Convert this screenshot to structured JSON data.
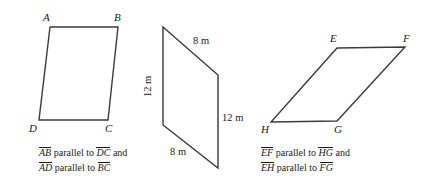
{
  "figure": {
    "background_color": "#ffffff",
    "stroke_color": "#333333",
    "shapes": [
      {
        "id": "parallelogram-abcd",
        "name": "left-parallelogram",
        "vertices": [
          {
            "label": "A",
            "x": 50,
            "y": 27
          },
          {
            "label": "B",
            "x": 118,
            "y": 27
          },
          {
            "label": "C",
            "x": 108,
            "y": 120
          },
          {
            "label": "D",
            "x": 39,
            "y": 120
          }
        ],
        "vertex_labels": [
          {
            "text": "A",
            "x": 43,
            "y": 12
          },
          {
            "text": "B",
            "x": 114,
            "y": 12
          },
          {
            "text": "C",
            "x": 105,
            "y": 123
          },
          {
            "text": "D",
            "x": 29,
            "y": 123
          }
        ],
        "caption": [
          {
            "seg1": "AB",
            "mid": " parallel to ",
            "seg2": "DC",
            "tail": " and"
          },
          {
            "seg1": "AD",
            "mid": " parallel to ",
            "seg2": "BC",
            "tail": ""
          }
        ]
      },
      {
        "id": "parallelogram-middle",
        "name": "middle-parallelogram",
        "vertices": [
          {
            "label": "",
            "x": 163,
            "y": 27
          },
          {
            "label": "",
            "x": 218,
            "y": 75
          },
          {
            "label": "",
            "x": 218,
            "y": 168
          },
          {
            "label": "",
            "x": 163,
            "y": 125
          }
        ],
        "dimensions": [
          {
            "text": "8 m",
            "x": 193,
            "y": 36,
            "orientation": "horizontal",
            "side": "top"
          },
          {
            "text": "12 m",
            "x": 147,
            "y": 92,
            "orientation": "vertical",
            "side": "left"
          },
          {
            "text": "12 m",
            "x": 222,
            "y": 113,
            "orientation": "horizontal",
            "side": "right"
          },
          {
            "text": "8 m",
            "x": 170,
            "y": 146,
            "orientation": "horizontal",
            "side": "bottom"
          }
        ]
      },
      {
        "id": "parallelogram-efgh",
        "name": "right-parallelogram",
        "vertices": [
          {
            "label": "E",
            "x": 337,
            "y": 48
          },
          {
            "label": "F",
            "x": 405,
            "y": 47
          },
          {
            "label": "G",
            "x": 337,
            "y": 121
          },
          {
            "label": "H",
            "x": 271,
            "y": 122
          }
        ],
        "vertex_labels": [
          {
            "text": "E",
            "x": 330,
            "y": 33
          },
          {
            "text": "F",
            "x": 403,
            "y": 33
          },
          {
            "text": "G",
            "x": 334,
            "y": 124
          },
          {
            "text": "H",
            "x": 261,
            "y": 124
          }
        ],
        "caption": [
          {
            "seg1": "EF",
            "mid": " parallel to ",
            "seg2": "HG",
            "tail": " and"
          },
          {
            "seg1": "EH",
            "mid": " parallel to ",
            "seg2": "FG",
            "tail": ""
          }
        ]
      }
    ]
  },
  "captions": {
    "left": {
      "line1_seg1": "AB",
      "line1_mid": " parallel to ",
      "line1_seg2": "DC",
      "line1_tail": " and",
      "line2_seg1": "AD",
      "line2_mid": " parallel to ",
      "line2_seg2": "BC"
    },
    "right": {
      "line1_seg1": "EF",
      "line1_mid": " parallel to ",
      "line1_seg2": "HG",
      "line1_tail": " and",
      "line2_seg1": "EH",
      "line2_mid": " parallel to ",
      "line2_seg2": "FG"
    }
  },
  "labels": {
    "A": "A",
    "B": "B",
    "C": "C",
    "D": "D",
    "E": "E",
    "F": "F",
    "G": "G",
    "H": "H"
  },
  "dimensions": {
    "mid_top": "8 m",
    "mid_left": "12 m",
    "mid_right": "12 m",
    "mid_bottom": "8 m"
  }
}
